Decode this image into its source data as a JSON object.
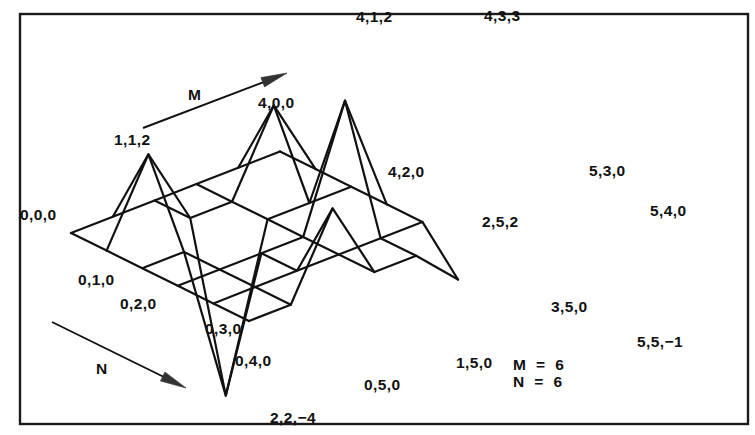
{
  "figure": {
    "background_color": "#ffffff",
    "line_color": "#111111",
    "frame_color": "#1a1a1a"
  },
  "frame": {
    "x": 20,
    "y": 14,
    "width": 728,
    "height": 410
  },
  "axes": {
    "m_axis": {
      "label": "M",
      "label_x": 188,
      "label_y": 100,
      "line": {
        "x1": 143,
        "y1": 128,
        "x2": 272,
        "y2": 79
      },
      "arrow_tip": {
        "x": 287,
        "y": 73
      }
    },
    "n_axis": {
      "label": "N",
      "label_x": 96,
      "label_y": 374,
      "line": {
        "x1": 52,
        "y1": 322,
        "x2": 168,
        "y2": 379
      },
      "arrow_tip": {
        "x": 186,
        "y": 388
      }
    }
  },
  "parameters": {
    "lines": [
      "M  =  6",
      "N  =  6"
    ],
    "x": 513,
    "y": 370,
    "line_height": 17
  },
  "chart_data": {
    "type": "surface",
    "grid_rows": 6,
    "grid_cols": 6,
    "row_param": "M",
    "col_param": "N",
    "xlabel": "M",
    "ylabel": "N",
    "zlabel": "Z",
    "projection": "isometric",
    "origin_px": {
      "x": 71,
      "y": 233
    },
    "step_m_px": {
      "x": 41.8,
      "y": -16.3
    },
    "step_n_px": {
      "x": 35.6,
      "y": 17.6
    },
    "z_scale_px": 40.0,
    "z_values": [
      [
        0,
        0,
        0,
        0,
        0,
        0
      ],
      [
        0,
        2,
        0,
        0,
        0,
        0
      ],
      [
        0,
        0,
        -4,
        0,
        0,
        2
      ],
      [
        0,
        0,
        0,
        0,
        0,
        0
      ],
      [
        0,
        2,
        0,
        3,
        0,
        0
      ],
      [
        0,
        0,
        0,
        0,
        0,
        -1
      ]
    ],
    "labeled_vertices": [
      {
        "m": 0,
        "n": 0,
        "z": 0,
        "text": "0,0,0",
        "x": 20,
        "y": 220,
        "anchor": "start"
      },
      {
        "m": 0,
        "n": 1,
        "z": 0,
        "text": "0,1,0",
        "x": 78,
        "y": 285,
        "anchor": "start"
      },
      {
        "m": 0,
        "n": 2,
        "z": 0,
        "text": "0,2,0",
        "x": 120,
        "y": 309,
        "anchor": "start"
      },
      {
        "m": 0,
        "n": 3,
        "z": 0,
        "text": "0,3,0",
        "x": 205,
        "y": 334,
        "anchor": "start"
      },
      {
        "m": 0,
        "n": 4,
        "z": 0,
        "text": "0,4,0",
        "x": 235,
        "y": 366,
        "anchor": "start"
      },
      {
        "m": 0,
        "n": 5,
        "z": 0,
        "text": "0,5,0",
        "x": 364,
        "y": 390,
        "anchor": "start"
      },
      {
        "m": 1,
        "n": 1,
        "z": 2,
        "text": "1,1,2",
        "x": 114,
        "y": 145,
        "anchor": "start"
      },
      {
        "m": 1,
        "n": 5,
        "z": 0,
        "text": "1,5,0",
        "x": 456,
        "y": 368,
        "anchor": "start"
      },
      {
        "m": 2,
        "n": 2,
        "z": -4,
        "text": "2,2,−4",
        "x": 270,
        "y": 423,
        "anchor": "start"
      },
      {
        "m": 2,
        "n": 5,
        "z": 2,
        "text": "2,5,2",
        "x": 482,
        "y": 227,
        "anchor": "start"
      },
      {
        "m": 3,
        "n": 5,
        "z": 0,
        "text": "3,5,0",
        "x": 551,
        "y": 312,
        "anchor": "start"
      },
      {
        "m": 4,
        "n": 0,
        "z": 0,
        "text": "4,0,0",
        "x": 258,
        "y": 108,
        "anchor": "start"
      },
      {
        "m": 4,
        "n": 1,
        "z": 2,
        "text": "4,1,2",
        "x": 356,
        "y": 22,
        "anchor": "start"
      },
      {
        "m": 4,
        "n": 2,
        "z": 0,
        "text": "4,2,0",
        "x": 388,
        "y": 177,
        "anchor": "start"
      },
      {
        "m": 4,
        "n": 3,
        "z": 3,
        "text": "4,3,3",
        "x": 484,
        "y": 21,
        "anchor": "start"
      },
      {
        "m": 5,
        "n": 3,
        "z": 0,
        "text": "5,3,0",
        "x": 589,
        "y": 176,
        "anchor": "start"
      },
      {
        "m": 5,
        "n": 4,
        "z": 0,
        "text": "5,4,0",
        "x": 650,
        "y": 216,
        "anchor": "start"
      },
      {
        "m": 5,
        "n": 5,
        "z": -1,
        "text": "5,5,−1",
        "x": 637,
        "y": 347,
        "anchor": "start"
      }
    ]
  }
}
